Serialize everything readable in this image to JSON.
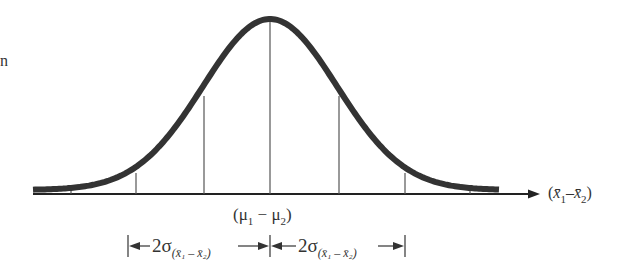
{
  "diagram": {
    "type": "normal-distribution",
    "stray_glyph": "n",
    "center_label": "(μ₁ − μ₂)",
    "center_label_parts": {
      "open": "(",
      "mu": "μ",
      "s1": "1",
      "minus": " − ",
      "s2": "2",
      "close": ")"
    },
    "axis_label_parts": {
      "open": "(",
      "x1": "x̄",
      "s1": "1",
      "minus": "–",
      "x2": "x̄",
      "s2": "2",
      "close": ")"
    },
    "interval_label_parts": {
      "coef": "2σ",
      "sub": "(x̄₁ – x̄₂)"
    },
    "interval_labels": [
      "2σ(x̄₁ – x̄₂)",
      "2σ(x̄₁ – x̄₂)"
    ],
    "vertical_lines_sd": [
      -2,
      -1,
      0,
      1,
      2
    ],
    "colors": {
      "curve": "#333333",
      "axis": "#222222",
      "lines": "#555555"
    }
  }
}
